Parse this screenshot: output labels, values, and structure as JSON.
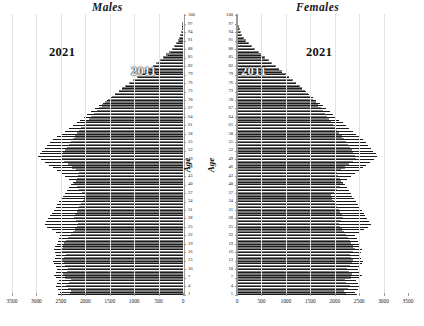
{
  "panels": {
    "males": {
      "title": "Males",
      "age_caption": "Age",
      "era_old": "2011",
      "era_new": "2021"
    },
    "females": {
      "title": "Females",
      "age_caption": "Age",
      "era_old": "2011",
      "era_new": "2021"
    }
  },
  "colors": {
    "bar_2021": "#7d7d7d",
    "bar_2011": "#1c1c1c",
    "gridline": "#e2e2e2",
    "axis": "#9a9a9a",
    "text": "#1a1a1a",
    "background": "#ffffff"
  },
  "chart_data": {
    "type": "bar",
    "orientation": "horizontal-butterfly",
    "xlabel": "",
    "ylabel": "Age",
    "grid": true,
    "legend_position": "in-plot-annotations",
    "xlim_males": [
      3500,
      0
    ],
    "xlim_females": [
      0,
      3500
    ],
    "ylim": [
      1,
      100
    ],
    "xticks_males": [
      3500,
      3000,
      2500,
      2000,
      1500,
      1000,
      500,
      0
    ],
    "xticks_females": [
      0,
      500,
      1000,
      1500,
      2000,
      2500,
      3000,
      3500
    ],
    "ytick_labels": [
      100,
      97,
      94,
      91,
      88,
      85,
      82,
      79,
      76,
      73,
      70,
      67,
      64,
      61,
      58,
      55,
      52,
      49,
      46,
      43,
      40,
      37,
      34,
      31,
      28,
      25,
      22,
      19,
      16,
      13,
      10,
      7,
      4,
      1
    ],
    "ages": [
      1,
      2,
      3,
      4,
      5,
      6,
      7,
      8,
      9,
      10,
      11,
      12,
      13,
      14,
      15,
      16,
      17,
      18,
      19,
      20,
      21,
      22,
      23,
      24,
      25,
      26,
      27,
      28,
      29,
      30,
      31,
      32,
      33,
      34,
      35,
      36,
      37,
      38,
      39,
      40,
      41,
      42,
      43,
      44,
      45,
      46,
      47,
      48,
      49,
      50,
      51,
      52,
      53,
      54,
      55,
      56,
      57,
      58,
      59,
      60,
      61,
      62,
      63,
      64,
      65,
      66,
      67,
      68,
      69,
      70,
      71,
      72,
      73,
      74,
      75,
      76,
      77,
      78,
      79,
      80,
      81,
      82,
      83,
      84,
      85,
      86,
      87,
      88,
      89,
      90,
      91,
      92,
      93,
      94,
      95,
      96,
      97,
      98,
      99,
      100
    ],
    "series": [
      {
        "name": "Males 2021",
        "sex": "male",
        "year": 2021,
        "color": "#7d7d7d",
        "values": [
          2320,
          2290,
          2360,
          2400,
          2330,
          2300,
          2420,
          2450,
          2380,
          2350,
          2410,
          2440,
          2470,
          2430,
          2400,
          2470,
          2500,
          2460,
          2430,
          2400,
          2360,
          2300,
          2260,
          2220,
          2180,
          2150,
          2200,
          2240,
          2210,
          2180,
          2150,
          2120,
          2080,
          2050,
          2020,
          2000,
          2060,
          2120,
          2180,
          2240,
          2200,
          2170,
          2140,
          2120,
          2200,
          2280,
          2360,
          2440,
          2500,
          2480,
          2450,
          2420,
          2380,
          2340,
          2300,
          2260,
          2210,
          2160,
          2120,
          2080,
          2030,
          1980,
          1930,
          1880,
          1830,
          1770,
          1710,
          1650,
          1590,
          1530,
          1460,
          1390,
          1320,
          1250,
          1180,
          1100,
          1020,
          940,
          860,
          780,
          700,
          620,
          550,
          480,
          410,
          345,
          285,
          230,
          180,
          140,
          108,
          80,
          58,
          40,
          27,
          18,
          12,
          7,
          4,
          2
        ]
      },
      {
        "name": "Males 2011",
        "sex": "male",
        "year": 2011,
        "color": "#1c1c1c",
        "values": [
          2550,
          2520,
          2560,
          2600,
          2570,
          2540,
          2600,
          2640,
          2600,
          2570,
          2600,
          2640,
          2660,
          2620,
          2590,
          2620,
          2650,
          2610,
          2580,
          2560,
          2540,
          2510,
          2600,
          2690,
          2780,
          2830,
          2800,
          2760,
          2720,
          2680,
          2640,
          2600,
          2570,
          2530,
          2490,
          2450,
          2420,
          2380,
          2340,
          2300,
          2260,
          2340,
          2420,
          2500,
          2580,
          2660,
          2740,
          2820,
          2900,
          2960,
          2930,
          2880,
          2830,
          2780,
          2720,
          2660,
          2580,
          2500,
          2420,
          2340,
          2260,
          2180,
          2100,
          2030,
          1960,
          1880,
          1800,
          1720,
          1640,
          1560,
          1480,
          1400,
          1320,
          1240,
          1160,
          1080,
          1000,
          920,
          840,
          760,
          680,
          600,
          520,
          450,
          380,
          315,
          255,
          200,
          155,
          118,
          88,
          64,
          45,
          31,
          20,
          13,
          8,
          5,
          3,
          1
        ]
      },
      {
        "name": "Females 2021",
        "sex": "female",
        "year": 2021,
        "color": "#7d7d7d",
        "values": [
          2230,
          2200,
          2270,
          2310,
          2240,
          2210,
          2330,
          2360,
          2290,
          2260,
          2320,
          2350,
          2380,
          2340,
          2310,
          2380,
          2410,
          2370,
          2340,
          2310,
          2280,
          2230,
          2190,
          2150,
          2110,
          2080,
          2130,
          2170,
          2140,
          2110,
          2080,
          2050,
          2010,
          1980,
          1950,
          1930,
          1990,
          2050,
          2110,
          2170,
          2130,
          2100,
          2070,
          2050,
          2130,
          2210,
          2290,
          2370,
          2430,
          2410,
          2380,
          2350,
          2310,
          2270,
          2230,
          2190,
          2140,
          2090,
          2050,
          2010,
          1970,
          1930,
          1890,
          1850,
          1810,
          1760,
          1710,
          1660,
          1610,
          1560,
          1510,
          1460,
          1400,
          1340,
          1280,
          1210,
          1140,
          1070,
          1000,
          930,
          860,
          790,
          720,
          650,
          580,
          510,
          440,
          370,
          300,
          240,
          190,
          145,
          108,
          78,
          54,
          36,
          23,
          14,
          8
        ]
      },
      {
        "name": "Females 2011",
        "sex": "female",
        "year": 2011,
        "color": "#1c1c1c",
        "values": [
          2450,
          2420,
          2470,
          2510,
          2470,
          2440,
          2510,
          2550,
          2510,
          2480,
          2510,
          2550,
          2570,
          2530,
          2500,
          2530,
          2560,
          2520,
          2490,
          2470,
          2450,
          2420,
          2510,
          2600,
          2690,
          2740,
          2710,
          2670,
          2630,
          2590,
          2550,
          2510,
          2480,
          2440,
          2400,
          2360,
          2330,
          2290,
          2250,
          2210,
          2170,
          2250,
          2330,
          2410,
          2490,
          2570,
          2650,
          2730,
          2810,
          2870,
          2840,
          2790,
          2740,
          2690,
          2640,
          2580,
          2510,
          2440,
          2370,
          2300,
          2230,
          2160,
          2090,
          2030,
          1970,
          1900,
          1830,
          1760,
          1690,
          1620,
          1550,
          1480,
          1410,
          1340,
          1270,
          1200,
          1130,
          1060,
          990,
          920,
          850,
          780,
          700,
          630,
          560,
          490,
          420,
          350,
          285,
          225,
          172,
          128,
          92,
          64,
          43,
          28,
          17,
          10,
          6
        ]
      }
    ]
  }
}
